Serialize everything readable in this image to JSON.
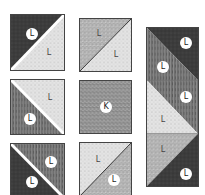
{
  "diagram": {
    "type": "quilt-block-layout",
    "fabric_colors": {
      "dark": "#3a3a3a",
      "medium_striped": "#6e6e6e",
      "medium_speckle": "#a8a8a8",
      "light": "#e2e2e2",
      "solid_speckle": "#8c8c8c"
    },
    "tiles": [
      {
        "id": "r1c1",
        "labels": [
          "L",
          "L"
        ]
      },
      {
        "id": "r1c2",
        "labels": [
          "L",
          "L"
        ]
      },
      {
        "id": "r2c1",
        "labels": [
          "L",
          "L"
        ]
      },
      {
        "id": "r2c2",
        "labels": [
          "K"
        ]
      },
      {
        "id": "r3c1",
        "labels": [
          "L",
          "L"
        ]
      },
      {
        "id": "r3c2",
        "labels": [
          "L",
          "L"
        ]
      }
    ],
    "strip": {
      "id": "col3",
      "units": [
        {
          "labels": [
            "L",
            "L"
          ]
        },
        {
          "labels": [
            "L",
            "L"
          ]
        },
        {
          "labels": [
            "L",
            "L"
          ]
        }
      ]
    }
  }
}
